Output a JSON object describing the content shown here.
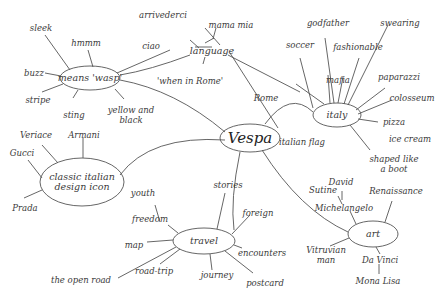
{
  "center": {
    "label": "Vespa"
  },
  "branches": {
    "means_wasp": {
      "label": "means 'wasp'",
      "children": [
        "sleek",
        "hmmm",
        "buzz",
        "stripe",
        "sting",
        "yellow and\nblack"
      ]
    },
    "language": {
      "label": "language",
      "children": [
        "arrivederci",
        "mama mia",
        "ciao",
        "'when in Rome'"
      ]
    },
    "italy": {
      "label": "italy",
      "children": [
        "godfather",
        "swearing",
        "soccer",
        "fashionable",
        "mafia",
        "paparazzi",
        "colosseum",
        "pizza",
        "ice cream",
        "shaped like\na boot",
        "italian flag",
        "Rome"
      ]
    },
    "design": {
      "label": "classic italian\ndesign icon",
      "children": [
        "Veriace",
        "Armani",
        "Gucci",
        "Prada"
      ]
    },
    "travel": {
      "label": "travel",
      "children": [
        "youth",
        "freedom",
        "stories",
        "foreign",
        "map",
        "encounters",
        "road-trip",
        "the open road",
        "journey",
        "postcard"
      ]
    },
    "art": {
      "label": "art",
      "children": [
        "Sutine",
        "David",
        "Michelangelo",
        "Renaissance",
        "Vitruvian\nman",
        "Da Vinci",
        "Mona Lisa"
      ]
    }
  }
}
